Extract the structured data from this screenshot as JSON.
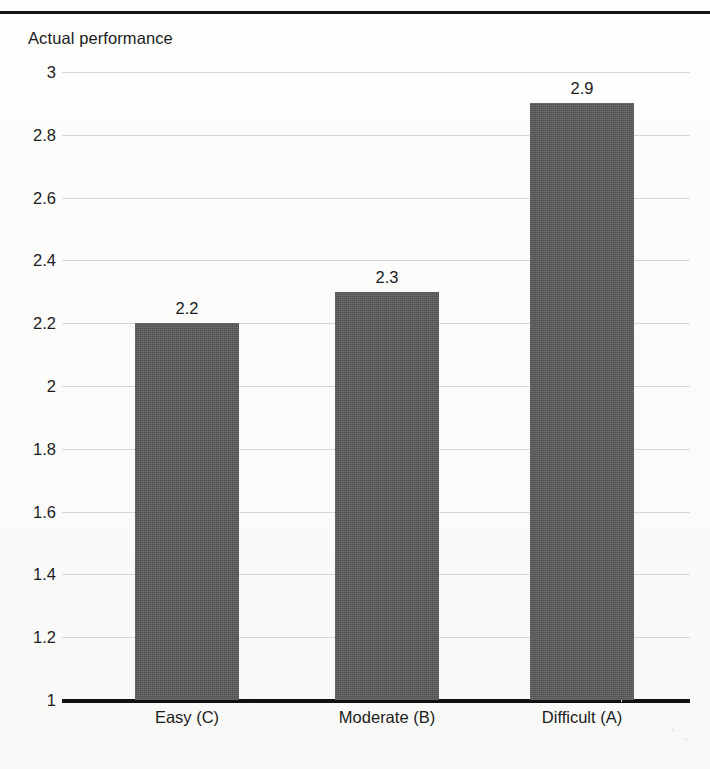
{
  "figure": {
    "y_axis_title": "Actual performance",
    "background_color": "#fcfcfb",
    "bar_color": "#585858",
    "gridline_color": "#d6d6d4",
    "axis_color": "#111111"
  },
  "chart_data": {
    "type": "bar",
    "title": "",
    "subtitle": "",
    "xlabel": "",
    "ylabel": "Actual performance",
    "categories": [
      "Easy (C)",
      "Moderate (B)",
      "Difficult (A)"
    ],
    "values": [
      2.2,
      2.3,
      2.9
    ],
    "value_labels": [
      "2.2",
      "2.3",
      "2.9"
    ],
    "ylim": [
      1,
      3
    ],
    "ytick_labels": [
      "3",
      "2.8",
      "2.6",
      "2.4",
      "2.2",
      "2",
      "1.8",
      "1.6",
      "1.4",
      "1.2",
      "1"
    ],
    "ytick_values": [
      3,
      2.8,
      2.6,
      2.4,
      2.2,
      2,
      1.8,
      1.6,
      1.4,
      1.2,
      1
    ],
    "grid": true,
    "grid_axis": "y",
    "legend": false,
    "legend_position": "none",
    "series": [
      {
        "name": "Actual performance",
        "values": [
          2.2,
          2.3,
          2.9
        ]
      }
    ]
  }
}
